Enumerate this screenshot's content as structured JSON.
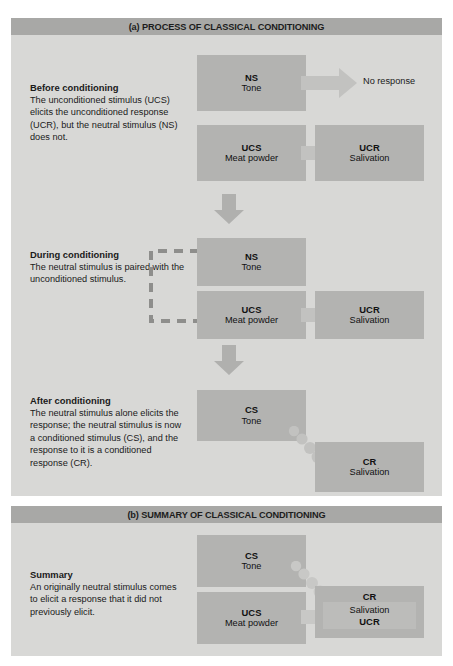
{
  "panels": {
    "a": {
      "header": "(a) PROCESS OF CLASSICAL CONDITIONING",
      "stages": [
        {
          "title": "Before conditioning",
          "body": "The unconditioned stimulus (UCS)  elicits the unconditioned response (UCR), but the neutral stimulus (NS) does not.",
          "boxes": [
            {
              "label": "NS",
              "sub": "Tone"
            },
            {
              "label": "UCS",
              "sub": "Meat powder"
            },
            {
              "label": "UCR",
              "sub": "Salivation"
            }
          ],
          "no_response": "No response"
        },
        {
          "title": "During conditioning",
          "body": "The neutral stimulus is paired with the unconditioned stimulus.",
          "boxes": [
            {
              "label": "NS",
              "sub": "Tone"
            },
            {
              "label": "UCS",
              "sub": "Meat powder"
            },
            {
              "label": "UCR",
              "sub": "Salivation"
            }
          ]
        },
        {
          "title": "After conditioning",
          "body": "The neutral stimulus alone elicits the response; the neutral stimulus is now a conditioned stimulus (CS), and the response to it is a conditioned response (CR).",
          "boxes": [
            {
              "label": "CS",
              "sub": "Tone"
            },
            {
              "label": "CR",
              "sub": "Salivation"
            }
          ]
        }
      ]
    },
    "b": {
      "header": "(b) SUMMARY OF CLASSICAL CONDITIONING",
      "title": "Summary",
      "body": "An originally neutral stimulus comes to elicit a response that it did not previously elicit.",
      "boxes": [
        {
          "label": "CS",
          "sub": "Tone"
        },
        {
          "label": "UCS",
          "sub": "Meat powder"
        },
        {
          "label": "CR",
          "sub": "Salivation",
          "extra": "UCR"
        }
      ]
    }
  },
  "colors": {
    "panel_bg": "#d8d8d6",
    "header_bg": "#a8a8a6",
    "box_bg": "#b3b3b1",
    "arrow": "#c2c2c0",
    "page_bg": "#ffffff"
  }
}
